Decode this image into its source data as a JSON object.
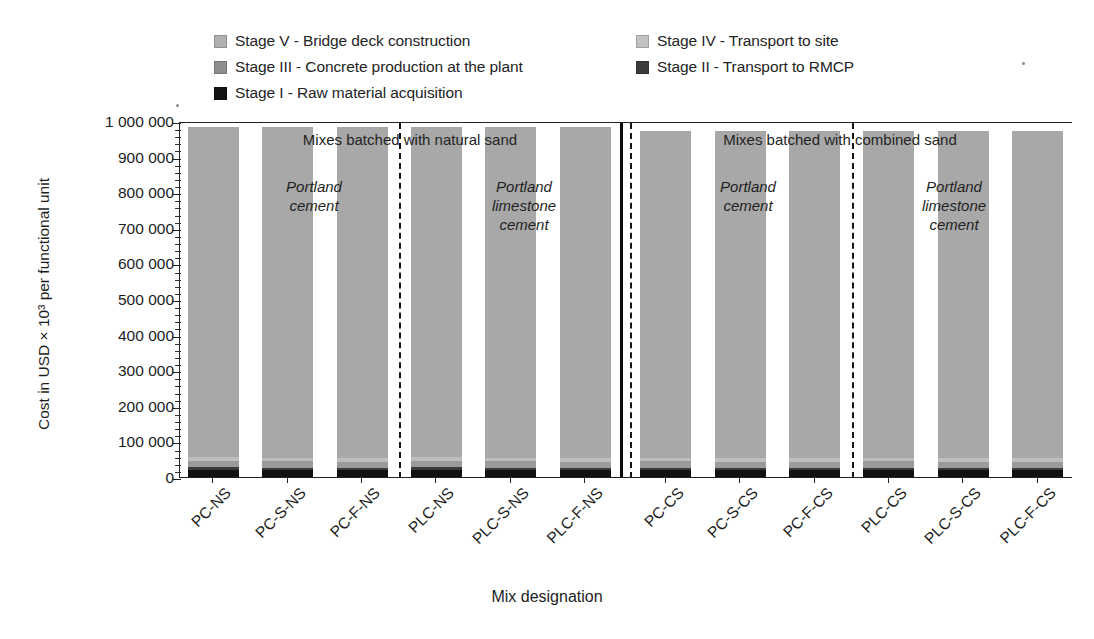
{
  "chart_data": {
    "type": "bar",
    "subtype": "stacked-bar",
    "title": "",
    "xlabel": "Mix designation",
    "ylabel": "Cost in USD × 10³ per functional unit",
    "ylim": [
      0,
      1000000
    ],
    "ytick_values": [
      0,
      100000,
      200000,
      300000,
      400000,
      500000,
      600000,
      700000,
      800000,
      900000,
      1000000
    ],
    "ytick_labels": [
      "0",
      "100 000",
      "200 000",
      "300 000",
      "400 000",
      "500 000",
      "600 000",
      "700 000",
      "800 000",
      "900 000",
      "1 000 000"
    ],
    "minor_ticks_per_interval": 5,
    "grid": false,
    "legend_position": "top",
    "categories": [
      "PC-NS",
      "PC-S-NS",
      "PC-F-NS",
      "PLC-NS",
      "PLC-S-NS",
      "PLC-F-NS",
      "PC-CS",
      "PC-S-CS",
      "PC-F-CS",
      "PLC-CS",
      "PLC-S-CS",
      "PLC-F-CS"
    ],
    "series": [
      {
        "name": "Stage I - Raw material acquisition",
        "color": "#111111",
        "values": [
          23000,
          22500,
          22000,
          23000,
          22500,
          22000,
          22500,
          22000,
          21500,
          22500,
          22000,
          21500
        ]
      },
      {
        "name": "Stage II - Transport to RMCP",
        "color": "#3a3a3a",
        "values": [
          7000,
          7000,
          7000,
          7000,
          7000,
          7000,
          7000,
          7000,
          7000,
          7000,
          7000,
          7000
        ]
      },
      {
        "name": "Stage III - Concrete production at the plant",
        "color": "#9a9a9a",
        "values": [
          17000,
          17000,
          17000,
          17000,
          17000,
          17000,
          17000,
          17000,
          17000,
          17000,
          17000,
          17000
        ]
      },
      {
        "name": "Stage IV - Transport to site",
        "color": "#bdbdbd",
        "values": [
          11000,
          11000,
          11000,
          11000,
          11000,
          11000,
          11000,
          11000,
          11000,
          11000,
          11000,
          11000
        ]
      },
      {
        "name": "Stage V - Bridge deck construction",
        "color": "#a8a8a8",
        "values": [
          927000,
          927500,
          928000,
          927000,
          927500,
          928000,
          918000,
          918500,
          919000,
          918000,
          918500,
          919000
        ]
      }
    ],
    "totals": [
      985000,
      985000,
      985000,
      985000,
      985000,
      985000,
      975500,
      975500,
      975500,
      975500,
      975500,
      975500
    ],
    "annotations": [
      {
        "text": "Mixes batched with natural sand",
        "group": "left-half"
      },
      {
        "text": "Mixes batched with combined sand",
        "group": "right-half"
      },
      {
        "text": "Portland cement",
        "group": "left-half-1"
      },
      {
        "text": "Portland limestone cement",
        "group": "left-half-2"
      },
      {
        "text": "Portland cement",
        "group": "right-half-1"
      },
      {
        "text": "Portland limestone cement",
        "group": "right-half-2"
      }
    ]
  },
  "legend": {
    "left_column": [
      {
        "label": "Stage V - Bridge deck construction",
        "color": "#b0b0b0",
        "icon": "legend-swatch-icon"
      },
      {
        "label": "Stage III - Concrete production at the plant",
        "color": "#8e8e8e",
        "icon": "legend-swatch-icon"
      },
      {
        "label": "Stage I - Raw material acquisition",
        "color": "#141414",
        "icon": "legend-swatch-icon"
      }
    ],
    "right_column": [
      {
        "label": "Stage IV - Transport to site",
        "color": "#c2c2c2",
        "icon": "legend-swatch-icon"
      },
      {
        "label": "Stage II - Transport to RMCP",
        "color": "#3b3b3b",
        "icon": "legend-swatch-icon"
      }
    ]
  },
  "axes": {
    "y_title": "Cost in USD × 10³ per functional unit",
    "x_title": "Mix designation",
    "y_ticks": [
      "1 000 000",
      "900 000",
      "800 000",
      "700 000",
      "600 000",
      "500 000",
      "400 000",
      "300 000",
      "200 000",
      "100 000",
      "0"
    ]
  },
  "annotations": {
    "natural_sand": "Mixes batched with natural sand",
    "combined_sand": "Mixes batched with combined sand",
    "portland_cement_1": "Portland\ncement",
    "portland_limestone_1": "Portland\nlimestone\ncement",
    "portland_cement_2": "Portland\ncement",
    "portland_limestone_2": "Portland\nlimestone\ncement",
    "pc_line1": "Portland",
    "pc_line2": "cement",
    "plc_line1": "Portland",
    "plc_line2": "limestone",
    "plc_line3": "cement"
  }
}
